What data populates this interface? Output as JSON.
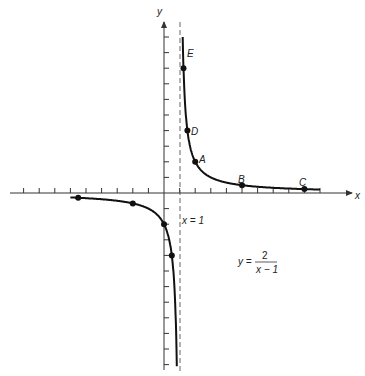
{
  "chart_data": {
    "type": "line",
    "title": "",
    "equation": {
      "lhs": "y =",
      "numerator": "2",
      "denominator": "x − 1"
    },
    "xlabel": "x",
    "ylabel": "y",
    "asymptote": {
      "label": "x = 1",
      "x": 1
    },
    "xlim": [
      -9.5,
      12
    ],
    "ylim": [
      -11,
      10
    ],
    "grid": false,
    "series": [
      {
        "name": "y = 2/(x-1)",
        "points": [
          {
            "label": "E",
            "x": 1.25,
            "y": 8
          },
          {
            "label": "D",
            "x": 1.5,
            "y": 4
          },
          {
            "label": "A",
            "x": 2,
            "y": 2
          },
          {
            "label": "B",
            "x": 5,
            "y": 0.5
          },
          {
            "label": "C",
            "x": 9,
            "y": 0.25
          },
          {
            "label": "",
            "x": -5.5,
            "y": -0.31
          },
          {
            "label": "",
            "x": -2,
            "y": -0.67
          },
          {
            "label": "",
            "x": 0,
            "y": -2
          },
          {
            "label": "",
            "x": 0.5,
            "y": -4
          }
        ]
      }
    ]
  },
  "labels": {
    "x_axis": "x",
    "y_axis": "y",
    "asymptote": "x = 1",
    "eq_lhs": "y =",
    "eq_num": "2",
    "eq_den": "x − 1",
    "A": "A",
    "B": "B",
    "C": "C",
    "D": "D",
    "E": "E"
  }
}
